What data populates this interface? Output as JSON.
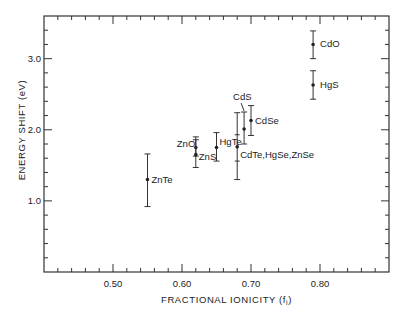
{
  "chart_data": {
    "type": "scatter",
    "title": "",
    "xlabel": "FRACTIONAL IONICITY (f",
    "xlabel_subscript": "i",
    "xlabel_close": ")",
    "ylabel": "ENERGY SHIFT (eV)",
    "xlim": [
      0.4,
      0.9
    ],
    "ylim": [
      0.0,
      3.6
    ],
    "grid": false,
    "legend": null,
    "x_major_ticks": [
      0.5,
      0.6,
      0.7,
      0.8
    ],
    "x_tick_labels": [
      "0.50",
      "0.60",
      "0.70",
      "0.80"
    ],
    "x_minor_step": 0.02,
    "y_major_ticks": [
      1.0,
      2.0,
      3.0
    ],
    "y_tick_labels": [
      "1.0",
      "2.0",
      "3.0"
    ],
    "y_minor_step": 0.2,
    "points": [
      {
        "label": "ZnTe",
        "x": 0.55,
        "y": 1.3,
        "err_low": 0.92,
        "err_high": 1.66,
        "label_dx": 4,
        "label_dy": 3
      },
      {
        "label": "ZnO",
        "x": 0.62,
        "y": 1.75,
        "err_low": 1.63,
        "err_high": 1.9,
        "label_dx": -19,
        "label_dy": -1
      },
      {
        "label": "ZnS",
        "x": 0.62,
        "y": 1.65,
        "err_low": 1.47,
        "err_high": 1.86,
        "label_dx": 3,
        "label_dy": 5
      },
      {
        "label": "HgTe",
        "x": 0.65,
        "y": 1.75,
        "err_low": 1.56,
        "err_high": 1.96,
        "label_dx": 3,
        "label_dy": -3
      },
      {
        "label": "CdTe,HgSe,ZnSe",
        "x": 0.68,
        "y": 1.76,
        "err_low": 1.3,
        "err_high": 2.24,
        "inner_low": 1.56,
        "inner_high": 1.93,
        "label_dx": 3,
        "label_dy": 11
      },
      {
        "label": "CdS",
        "x": 0.69,
        "y": 2.01,
        "err_low": 1.8,
        "err_high": 2.25,
        "label_dx": -11,
        "label_dy": -29,
        "leader": true
      },
      {
        "label": "CdSe",
        "x": 0.7,
        "y": 2.13,
        "err_low": 1.92,
        "err_high": 2.34,
        "label_dx": 4,
        "label_dy": 3
      },
      {
        "label": "CdO",
        "x": 0.79,
        "y": 3.2,
        "err_low": 3.0,
        "err_high": 3.39,
        "label_dx": 7,
        "label_dy": 3
      },
      {
        "label": "HgS",
        "x": 0.79,
        "y": 2.63,
        "err_low": 2.43,
        "err_high": 2.83,
        "label_dx": 7,
        "label_dy": 3
      }
    ]
  },
  "layout": {
    "frame": {
      "left": 44,
      "top": 16,
      "right": 389,
      "bottom": 272
    }
  }
}
